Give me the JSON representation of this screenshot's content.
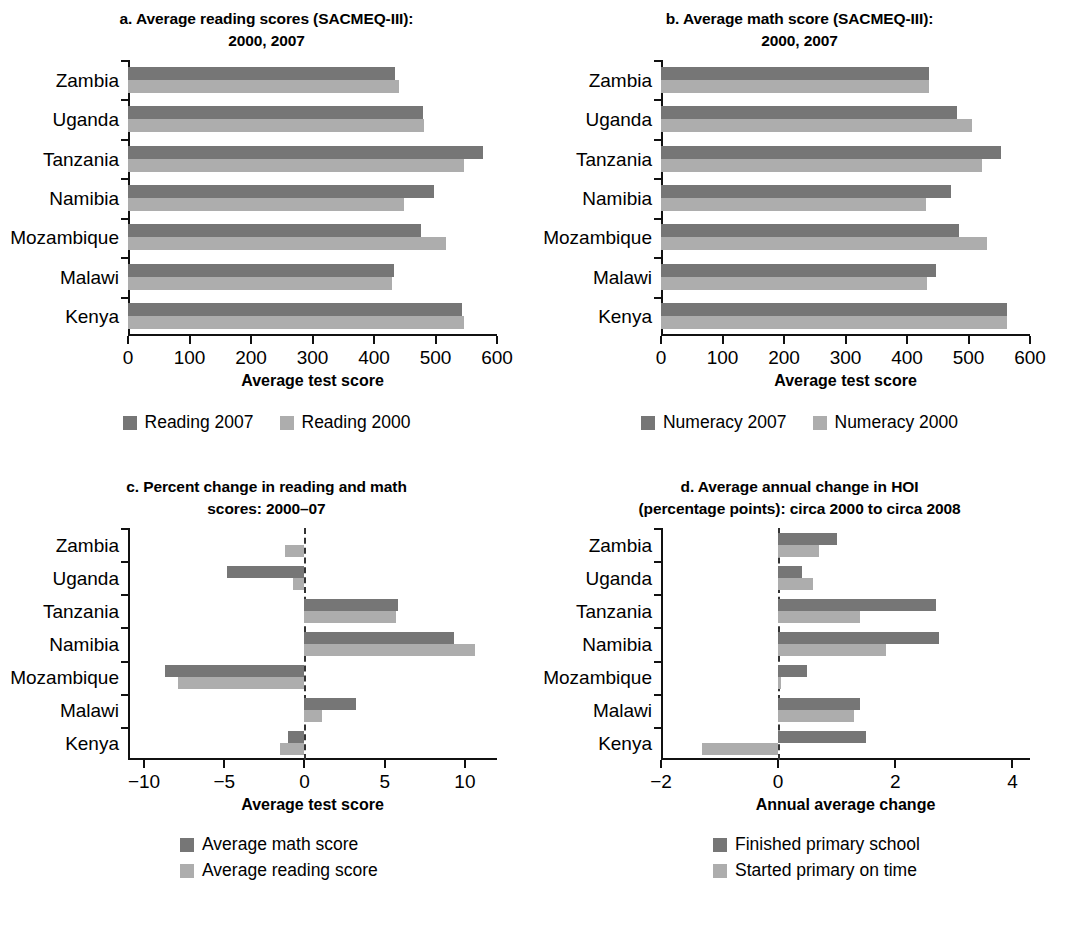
{
  "colors": {
    "dark": "#767676",
    "light": "#adadad",
    "axis": "#111111"
  },
  "panels": {
    "a": {
      "title": "a. Average reading scores (SACMEQ-III):\n2000, 2007",
      "xaxis_title": "Average test score",
      "legend": [
        {
          "label": "Reading 2007",
          "tone": "dark"
        },
        {
          "label": "Reading 2000",
          "tone": "light"
        }
      ]
    },
    "b": {
      "title": "b. Average math score (SACMEQ-III):\n2000, 2007",
      "xaxis_title": "Average test score",
      "legend": [
        {
          "label": "Numeracy 2007",
          "tone": "dark"
        },
        {
          "label": "Numeracy 2000",
          "tone": "light"
        }
      ]
    },
    "c": {
      "title": "c. Percent change in reading and math\nscores: 2000–07",
      "xaxis_title": "Average test score",
      "legend": [
        {
          "label": "Average math score",
          "tone": "dark"
        },
        {
          "label": "Average reading score",
          "tone": "light"
        }
      ]
    },
    "d": {
      "title": "d. Average annual change in HOI\n(percentage points): circa 2000 to circa 2008",
      "xaxis_title": "Annual average change",
      "legend": [
        {
          "label": "Finished primary school",
          "tone": "dark"
        },
        {
          "label": "Started primary on time",
          "tone": "light"
        }
      ]
    }
  },
  "chart_data": [
    {
      "id": "a",
      "type": "bar",
      "orientation": "horizontal",
      "title": "a. Average reading scores (SACMEQ-III): 2000, 2007",
      "xlabel": "Average test score",
      "ylabel": "",
      "xlim": [
        0,
        600
      ],
      "xticks": [
        0,
        100,
        200,
        300,
        400,
        500,
        600
      ],
      "grid": false,
      "legend_position": "bottom",
      "categories": [
        "Zambia",
        "Uganda",
        "Tanzania",
        "Namibia",
        "Mozambique",
        "Malawi",
        "Kenya"
      ],
      "series": [
        {
          "name": "Reading 2007",
          "tone": "dark",
          "values": [
            434,
            479,
            578,
            497,
            476,
            433,
            543
          ]
        },
        {
          "name": "Reading 2000",
          "tone": "light",
          "values": [
            440,
            482,
            546,
            449,
            517,
            429,
            547
          ]
        }
      ]
    },
    {
      "id": "b",
      "type": "bar",
      "orientation": "horizontal",
      "title": "b. Average math score (SACMEQ-III): 2000, 2007",
      "xlabel": "Average test score",
      "ylabel": "",
      "xlim": [
        0,
        600
      ],
      "xticks": [
        0,
        100,
        200,
        300,
        400,
        500,
        600
      ],
      "grid": false,
      "legend_position": "bottom",
      "categories": [
        "Zambia",
        "Uganda",
        "Tanzania",
        "Namibia",
        "Mozambique",
        "Malawi",
        "Kenya"
      ],
      "series": [
        {
          "name": "Numeracy 2007",
          "tone": "dark",
          "values": [
            435,
            482,
            553,
            471,
            484,
            447,
            563
          ]
        },
        {
          "name": "Numeracy 2000",
          "tone": "light",
          "values": [
            435,
            506,
            522,
            431,
            530,
            433,
            563
          ]
        }
      ]
    },
    {
      "id": "c",
      "type": "bar",
      "orientation": "horizontal",
      "title": "c. Percent change in reading and math scores: 2000–07",
      "xlabel": "Average test score",
      "ylabel": "",
      "xlim": [
        -11,
        12
      ],
      "xticks": [
        -10,
        -5,
        0,
        5,
        10
      ],
      "grid": false,
      "legend_position": "bottom",
      "categories": [
        "Zambia",
        "Uganda",
        "Tanzania",
        "Namibia",
        "Mozambique",
        "Malawi",
        "Kenya"
      ],
      "series": [
        {
          "name": "Average math score",
          "tone": "dark",
          "values": [
            0.0,
            -4.8,
            5.8,
            9.3,
            -8.7,
            3.2,
            -1.0
          ]
        },
        {
          "name": "Average reading score",
          "tone": "light",
          "values": [
            -1.2,
            -0.7,
            5.7,
            10.6,
            -7.9,
            1.1,
            -1.5
          ]
        }
      ]
    },
    {
      "id": "d",
      "type": "bar",
      "orientation": "horizontal",
      "title": "d. Average annual change in HOI (percentage points): circa 2000 to circa 2008",
      "xlabel": "Annual average change",
      "ylabel": "",
      "xlim": [
        -2,
        4.3
      ],
      "xticks": [
        -2,
        0,
        2,
        4
      ],
      "grid": false,
      "legend_position": "bottom",
      "categories": [
        "Zambia",
        "Uganda",
        "Tanzania",
        "Namibia",
        "Mozambique",
        "Malawi",
        "Kenya"
      ],
      "series": [
        {
          "name": "Finished primary school",
          "tone": "dark",
          "values": [
            1.0,
            0.4,
            2.7,
            2.75,
            0.5,
            1.4,
            1.5
          ]
        },
        {
          "name": "Started primary on time",
          "tone": "light",
          "values": [
            0.7,
            0.6,
            1.4,
            1.85,
            0.05,
            1.3,
            -1.3
          ]
        }
      ]
    }
  ]
}
